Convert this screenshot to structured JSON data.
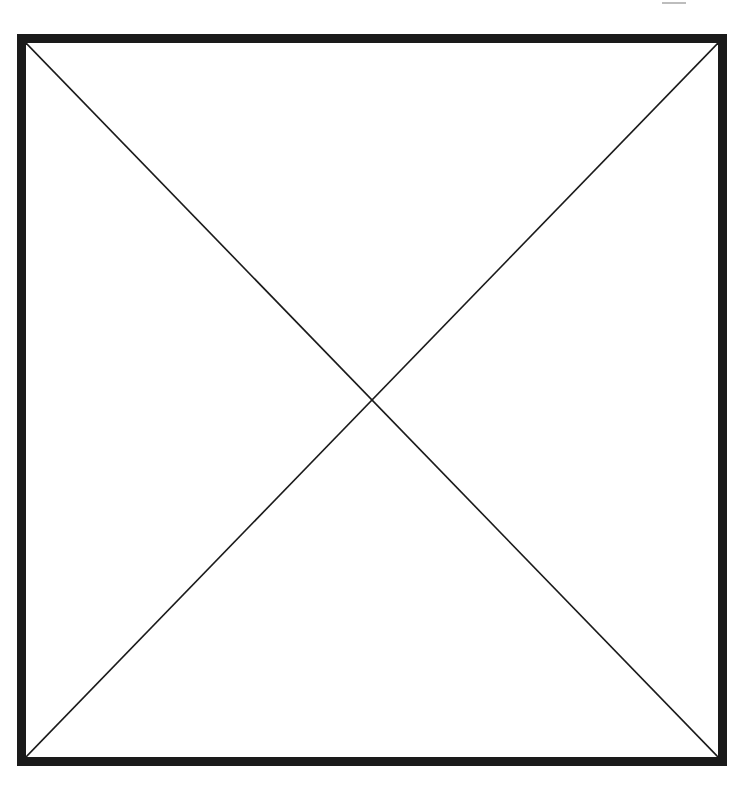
{
  "diagram": {
    "type": "placeholder-box-with-x",
    "frame": {
      "stroke_color": "#1a1a1a",
      "border_width": 9,
      "line_color": "#1a1a1a",
      "line_width": 1.6
    },
    "elements": [
      {
        "kind": "rectangle",
        "label": ""
      },
      {
        "kind": "diagonal",
        "from": "top-left",
        "to": "bottom-right"
      },
      {
        "kind": "diagonal",
        "from": "top-right",
        "to": "bottom-left"
      }
    ]
  }
}
